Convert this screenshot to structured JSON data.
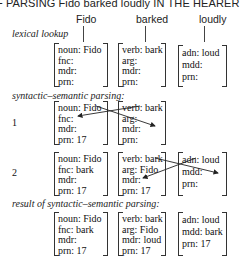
{
  "title": "F PARSING Fido barked loudly IN THE HEARER",
  "words": [
    "Fido",
    "barked",
    "loudly"
  ],
  "sections": {
    "lexical": "lexical lookup",
    "parsing": "syntactic–semantic parsing:",
    "result": "result of syntactic–semantic parsing:"
  },
  "steps": [
    "1",
    "2"
  ],
  "lexical": {
    "fido": [
      "noun: Fido",
      "fnc:",
      "mdr:",
      "prn:"
    ],
    "bark": [
      "verb: bark",
      "arg:",
      "mdr:",
      "prn:"
    ],
    "loud": [
      "adn: loud",
      "mdd:",
      "prn:"
    ]
  },
  "step1": {
    "fido": [
      "noun: Fido",
      "fnc:",
      "mdr:",
      "prn: 17"
    ],
    "bark": [
      "verb: bark",
      "arg:",
      "mdr:",
      "prn:"
    ]
  },
  "step2": {
    "fido": [
      "noun: Fido",
      "fnc: bark",
      "mdr:",
      "prn: 17"
    ],
    "bark": [
      "verb: bark",
      "arg: Fido",
      "mdr:",
      "prn: 17"
    ],
    "loud": [
      "adn: loud",
      "mdd:",
      "prn:"
    ]
  },
  "result": {
    "fido": [
      "noun: Fido",
      "fnc: bark",
      "mdr:",
      "prn: 17"
    ],
    "bark": [
      "verb: bark",
      "arg: Fido",
      "mdr: loud",
      "prn: 17"
    ],
    "loud": [
      "adn: loud",
      "mdd: bark",
      "prn: 17"
    ]
  }
}
